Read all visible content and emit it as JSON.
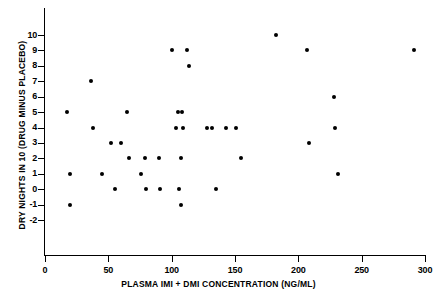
{
  "chart_data": {
    "type": "scatter",
    "title": "",
    "xlabel": "PLASMA IMI + DMI CONCENTRATION (NG/ML)",
    "ylabel": "DRY NIGHTS IN 10 (DRUG MINUS PLACEBO)",
    "xlim": [
      0,
      300
    ],
    "ylim": [
      -2,
      10
    ],
    "xticks": [
      0,
      50,
      100,
      150,
      200,
      250,
      300
    ],
    "xtick_labels": [
      "0",
      "50",
      "100",
      "150",
      "200",
      "250",
      "300"
    ],
    "yticks": [
      -2,
      -1,
      0,
      1,
      2,
      3,
      4,
      5,
      6,
      7,
      8,
      9,
      10
    ],
    "ytick_labels": [
      "-2",
      "-1",
      "0",
      "1",
      "2",
      "3",
      "4",
      "5",
      "6",
      "7",
      "8",
      "9",
      "10"
    ],
    "grid": false,
    "legend": null,
    "marker": "filled-circle",
    "marker_color": "#000000",
    "points": [
      {
        "x": 17,
        "y": 5
      },
      {
        "x": 20,
        "y": 1
      },
      {
        "x": 20,
        "y": -1
      },
      {
        "x": 36,
        "y": 7
      },
      {
        "x": 38,
        "y": 4
      },
      {
        "x": 45,
        "y": 1
      },
      {
        "x": 52,
        "y": 3
      },
      {
        "x": 55,
        "y": 0
      },
      {
        "x": 60,
        "y": 3
      },
      {
        "x": 65,
        "y": 5
      },
      {
        "x": 66,
        "y": 2
      },
      {
        "x": 76,
        "y": 1
      },
      {
        "x": 79,
        "y": 2
      },
      {
        "x": 80,
        "y": 0
      },
      {
        "x": 90,
        "y": 2
      },
      {
        "x": 91,
        "y": 0
      },
      {
        "x": 100,
        "y": 9
      },
      {
        "x": 103,
        "y": 4
      },
      {
        "x": 105,
        "y": 5
      },
      {
        "x": 106,
        "y": 0
      },
      {
        "x": 107,
        "y": 2
      },
      {
        "x": 107,
        "y": -1
      },
      {
        "x": 108,
        "y": 5
      },
      {
        "x": 109,
        "y": 4
      },
      {
        "x": 112,
        "y": 9
      },
      {
        "x": 114,
        "y": 8
      },
      {
        "x": 128,
        "y": 4
      },
      {
        "x": 132,
        "y": 4
      },
      {
        "x": 135,
        "y": 0
      },
      {
        "x": 143,
        "y": 4
      },
      {
        "x": 151,
        "y": 4
      },
      {
        "x": 155,
        "y": 2
      },
      {
        "x": 182,
        "y": 10
      },
      {
        "x": 207,
        "y": 9
      },
      {
        "x": 208,
        "y": 3
      },
      {
        "x": 228,
        "y": 6
      },
      {
        "x": 229,
        "y": 4
      },
      {
        "x": 231,
        "y": 1
      },
      {
        "x": 291,
        "y": 9
      }
    ]
  },
  "axes": {
    "x_title": "PLASMA IMI + DMI CONCENTRATION (NG/ML)",
    "y_title": "DRY NIGHTS IN 10 (DRUG MINUS PLACEBO)"
  }
}
